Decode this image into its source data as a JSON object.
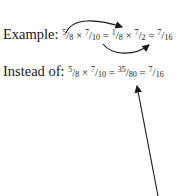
{
  "example": {
    "label": "Example:",
    "terms": [
      {
        "num": "5",
        "den": "8"
      },
      {
        "op": "×"
      },
      {
        "num": "7",
        "den": "10"
      },
      {
        "op": "="
      },
      {
        "num": "1",
        "den": "8"
      },
      {
        "op": "×"
      },
      {
        "num": "7",
        "den": "2"
      },
      {
        "op": "="
      },
      {
        "num": "7",
        "den": "16"
      }
    ]
  },
  "instead": {
    "label": "Instead of:",
    "terms": [
      {
        "num": "5",
        "den": "8"
      },
      {
        "op": "×"
      },
      {
        "num": "7",
        "den": "10"
      },
      {
        "op": "="
      },
      {
        "num": "35",
        "den": "80"
      },
      {
        "op": "="
      },
      {
        "num": "7",
        "den": "16"
      }
    ]
  },
  "slash": "/",
  "arrows": [
    {
      "description": "cancel 5 with 10 giving 1 and 2 (top curved arrow)"
    },
    {
      "description": "from 10 to 2 (bottom curved arrow)"
    },
    {
      "description": "pointer to 35/80 from below"
    }
  ]
}
